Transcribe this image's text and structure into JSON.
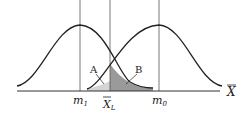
{
  "diagram": {
    "type": "two-normal-distributions-hypothesis-test",
    "axis_label": "X̄",
    "curves": [
      {
        "name": "left-distribution",
        "mean_label": "m",
        "mean_sub": "1"
      },
      {
        "name": "right-distribution",
        "mean_label": "m",
        "mean_sub": "0"
      }
    ],
    "threshold": {
      "label": "X̄",
      "sub": "L"
    },
    "regions": [
      {
        "label": "A",
        "shade": "#d0d0d0",
        "description": "area under right curve left of X̄L"
      },
      {
        "label": "B",
        "shade": "#9a9a9a",
        "description": "area under left curve right of X̄L"
      }
    ],
    "labels": {
      "m1": "m",
      "m1_sub": "1",
      "m0": "m",
      "m0_sub": "0",
      "xl": "X",
      "xl_sub": "L",
      "axis": "X",
      "a": "A",
      "b": "B"
    }
  }
}
